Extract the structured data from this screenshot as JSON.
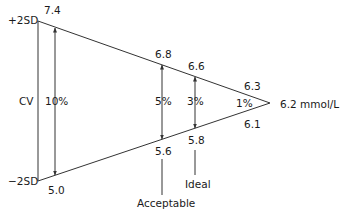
{
  "diagram": {
    "type": "precision-triangle",
    "colors": {
      "line": "#333333",
      "text": "#1a1a1a",
      "background": "#ffffff"
    },
    "labels": {
      "plus_2sd": "+2SD",
      "minus_2sd": "−2SD",
      "cv": "CV",
      "target": "6.2 mmol/L",
      "acceptable": "Acceptable",
      "ideal": "Ideal"
    },
    "levels": [
      {
        "cv": "10%",
        "upper": "7.4",
        "lower": "5.0"
      },
      {
        "cv": "5%",
        "upper": "6.8",
        "lower": "5.6"
      },
      {
        "cv": "3%",
        "upper": "6.6",
        "lower": "5.8"
      },
      {
        "cv": "1%",
        "upper": "6.3",
        "lower": "6.1"
      }
    ]
  }
}
